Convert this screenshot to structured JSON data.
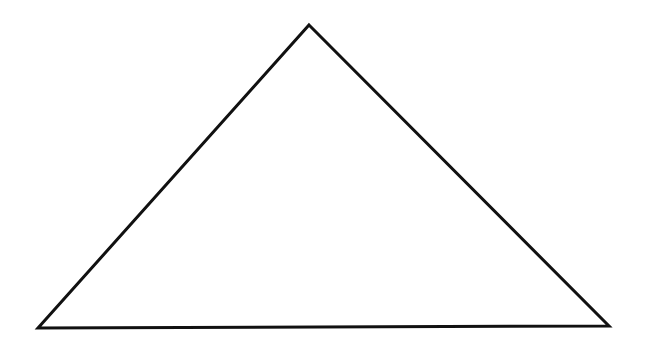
{
  "diagram": {
    "background": "#ffffff",
    "shape": "triangle",
    "stroke_color": "#111111",
    "stroke_width": 3,
    "fill": "none",
    "vertices": {
      "apex": [
        309,
        25
      ],
      "bottom_left": [
        38,
        328
      ],
      "bottom_right": [
        609,
        326
      ]
    }
  }
}
